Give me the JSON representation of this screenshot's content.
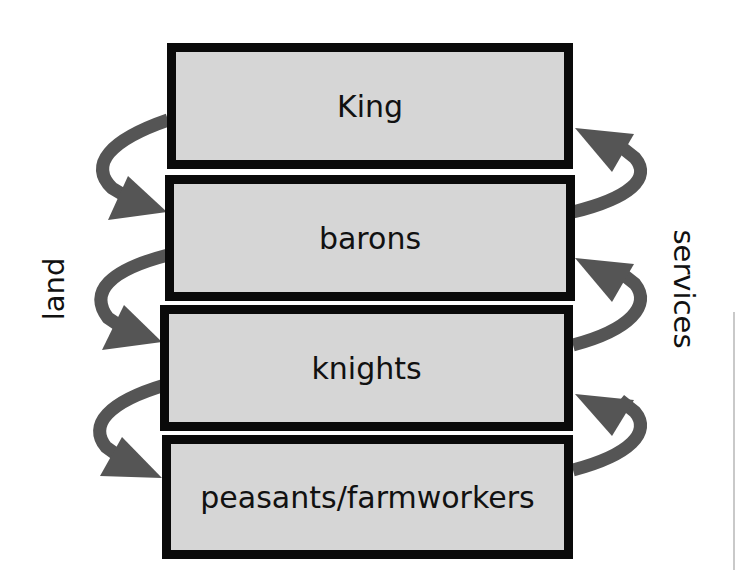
{
  "diagram": {
    "type": "feudal-hierarchy",
    "levels": [
      {
        "label": "King"
      },
      {
        "label": "barons"
      },
      {
        "label": "knights"
      },
      {
        "label": "peasants/farmworkers"
      }
    ],
    "left_label": "land",
    "right_label": "services",
    "left_flow": "downward (land granted from each level to the one below)",
    "right_flow": "upward (services given from each level to the one above)"
  },
  "colors": {
    "box_fill": "#d6d6d6",
    "box_border": "#0a0a0a",
    "arrow": "#555555",
    "text": "#111111",
    "background": "#ffffff"
  }
}
